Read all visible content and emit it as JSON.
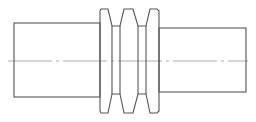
{
  "drawing": {
    "title": "Stepped shaft with triple-groove V-belt pulley",
    "colors": {
      "background": "#ffffff",
      "outline": "#555555",
      "centerline": "#9a9a9a"
    },
    "parts": {
      "left_shaft": {
        "x1": 14,
        "x2": 100,
        "y1": 23,
        "y2": 97
      },
      "right_shaft": {
        "x1": 159,
        "x2": 246,
        "y1": 28,
        "y2": 92
      },
      "pulley": {
        "flange_outer_top": 9,
        "flange_outer_bottom": 113,
        "groove_floor_top": 26,
        "groove_floor_bottom": 94,
        "flanges": [
          {
            "x1": 100,
            "x2": 111
          },
          {
            "x1": 120,
            "x2": 138
          },
          {
            "x1": 146,
            "x2": 159
          }
        ],
        "grooves": [
          {
            "x1": 111,
            "x2": 120
          },
          {
            "x1": 138,
            "x2": 146
          }
        ]
      },
      "centerline": {
        "x1": 8,
        "x2": 248,
        "y": 61
      }
    }
  }
}
